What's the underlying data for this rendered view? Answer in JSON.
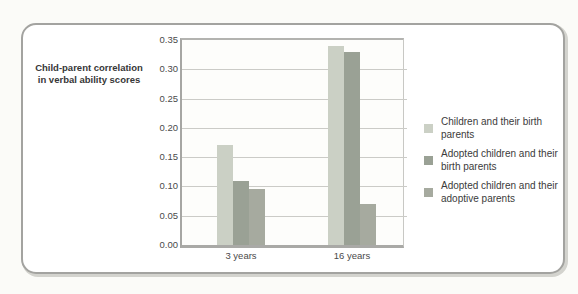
{
  "figure": {
    "background": "#fbfbf8",
    "panel_border_color": "#a3a3a0"
  },
  "chart_data": {
    "type": "bar",
    "title_lines": [
      "Child-parent correlation",
      "in verbal ability scores"
    ],
    "title": "Child-parent correlation in verbal ability scores",
    "categories": [
      "3 years",
      "16 years"
    ],
    "series": [
      {
        "name": "Children and their birth parents",
        "values": [
          0.17,
          0.34
        ],
        "color": "#cbd0c5"
      },
      {
        "name": "Adopted children and their birth parents",
        "values": [
          0.11,
          0.33
        ],
        "color": "#9aa195"
      },
      {
        "name": "Adopted children and their adoptive parents",
        "values": [
          0.095,
          0.07
        ],
        "color": "#a6aa9f"
      }
    ],
    "xlabel": "",
    "ylabel": "Child-parent correlation in verbal ability scores",
    "ylim": [
      0,
      0.35
    ],
    "ytick_step": 0.05,
    "ytick_labels": [
      "0.00",
      "0.05",
      "0.10",
      "0.15",
      "0.20",
      "0.25",
      "0.30",
      "0.35"
    ],
    "grid": true,
    "legend_position": "right"
  }
}
